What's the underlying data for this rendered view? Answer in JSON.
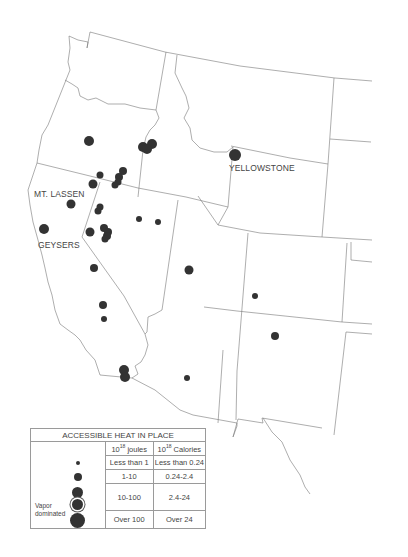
{
  "map": {
    "title": "Geothermal resources of the western United States",
    "labels": {
      "yellowstone": "YELLOWSTONE",
      "mt_lassen": "MT. LASSEN",
      "geysers": "GEYSERS"
    },
    "colors": {
      "border": "#777777",
      "site": "#333333",
      "text": "#444444"
    },
    "sites": [
      {
        "x": 89,
        "y": 141,
        "r": 5
      },
      {
        "x": 143,
        "y": 147,
        "r": 5
      },
      {
        "x": 152,
        "y": 144,
        "r": 5
      },
      {
        "x": 147,
        "y": 149,
        "r": 5
      },
      {
        "x": 235,
        "y": 155,
        "r": 6
      },
      {
        "x": 100,
        "y": 175,
        "r": 3.5
      },
      {
        "x": 123,
        "y": 171,
        "r": 4
      },
      {
        "x": 119,
        "y": 177,
        "r": 4
      },
      {
        "x": 118,
        "y": 182,
        "r": 3.5
      },
      {
        "x": 93,
        "y": 184,
        "r": 4.5
      },
      {
        "x": 115,
        "y": 185,
        "r": 3.5
      },
      {
        "x": 71,
        "y": 204,
        "r": 4.5
      },
      {
        "x": 100,
        "y": 207,
        "r": 3.5
      },
      {
        "x": 98,
        "y": 211,
        "r": 3.5
      },
      {
        "x": 139,
        "y": 219,
        "r": 3
      },
      {
        "x": 158,
        "y": 222,
        "r": 3
      },
      {
        "x": 44,
        "y": 229,
        "r": 5
      },
      {
        "x": 90,
        "y": 232,
        "r": 4.5
      },
      {
        "x": 104,
        "y": 228,
        "r": 4
      },
      {
        "x": 108,
        "y": 232,
        "r": 4
      },
      {
        "x": 107,
        "y": 236,
        "r": 4
      },
      {
        "x": 105,
        "y": 239,
        "r": 3.5
      },
      {
        "x": 94,
        "y": 268,
        "r": 4
      },
      {
        "x": 189,
        "y": 270,
        "r": 4.5
      },
      {
        "x": 255,
        "y": 296,
        "r": 3
      },
      {
        "x": 103,
        "y": 305,
        "r": 4
      },
      {
        "x": 104,
        "y": 319,
        "r": 3
      },
      {
        "x": 275,
        "y": 336,
        "r": 4
      },
      {
        "x": 124,
        "y": 370,
        "r": 5
      },
      {
        "x": 125,
        "y": 377,
        "r": 5
      },
      {
        "x": 187,
        "y": 378,
        "r": 3
      }
    ]
  },
  "legend": {
    "title": "ACCESSIBLE HEAT IN PLACE",
    "col_joules": "10",
    "col_joules_exp": "18",
    "col_joules_unit": "joules",
    "col_calories": "10",
    "col_calories_exp": "18",
    "col_calories_unit": "Calories",
    "vapor_label_1": "Vapor",
    "vapor_label_2": "dominated",
    "rows": [
      {
        "joules": "Less than 1",
        "calories": "Less than 0.24",
        "dot_size": 4
      },
      {
        "joules": "1-10",
        "calories": "0.24-2.4",
        "dot_size": 8
      },
      {
        "joules": "10-100",
        "calories": "2.4-24",
        "dot_size": 11
      },
      {
        "joules": "Over 100",
        "calories": "Over 24",
        "dot_size": 15
      }
    ]
  }
}
